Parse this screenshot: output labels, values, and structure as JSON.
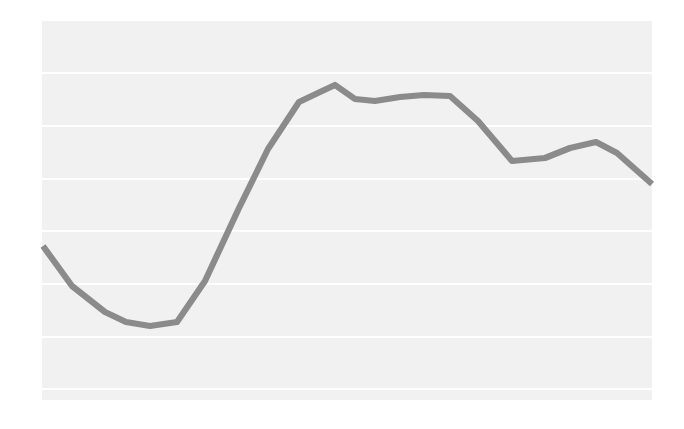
{
  "chart_data": {
    "type": "line",
    "title": "",
    "subtitle": "",
    "xlabel": "",
    "ylabel": "",
    "grid": true,
    "gridlines_horizontal": true,
    "gridlines_vertical": false,
    "legend": false,
    "legend_position": "none",
    "axes_visible": false,
    "tick_labels_x": [],
    "tick_labels_y": [],
    "annotations": [],
    "xlim": [
      0,
      22
    ],
    "ylim": [
      0,
      100
    ],
    "x": [
      0,
      1,
      2,
      3,
      4,
      5,
      6,
      7,
      8,
      9,
      10,
      11,
      12,
      13,
      14,
      15,
      16,
      17,
      18,
      19,
      20,
      21
    ],
    "series": [
      {
        "name": "series-1",
        "color": "#8b8b8b",
        "line_width": 6,
        "values": [
          41,
          31,
          24,
          21,
          21,
          26,
          44,
          64,
          79,
          89,
          91,
          88,
          87,
          87,
          86,
          84,
          76,
          65,
          65,
          71,
          73,
          58
        ]
      }
    ],
    "pixel_geometry": {
      "plot_left": 42,
      "plot_top": 21,
      "plot_right": 652,
      "plot_bottom": 400,
      "plot_background": "#f1f1f1",
      "gridline_color": "#ffffff",
      "gridline_rows_y": [
        73,
        126,
        179,
        231,
        284,
        337,
        389
      ],
      "polyline_points": "43,246 72,286 105,312 126,322 150,326 177,322 205,281 239,208 268,149 299,102 320,92 335,85 355,99 375,101 400,97 424,95 450,96 478,121 512,161 545,158 570,148 596,142 617,153 652,184"
    }
  }
}
